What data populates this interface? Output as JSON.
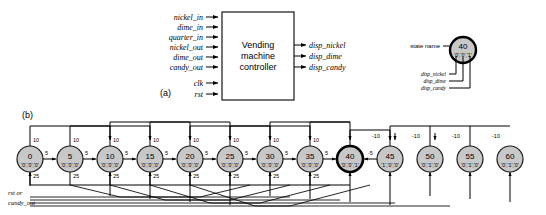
{
  "figure": {
    "part_a_label": "(a)",
    "part_b_label": "(b)"
  },
  "block_diagram": {
    "box_title_line1": "Vending",
    "box_title_line2": "machine",
    "box_title_line3": "controller",
    "inputs": [
      "nickel_in",
      "dime_in",
      "quarter_in",
      "nickel_out",
      "dime_out",
      "candy_out"
    ],
    "control_inputs": [
      "clk",
      "rst"
    ],
    "outputs": [
      "disp_nickel",
      "disp_dime",
      "disp_candy"
    ]
  },
  "legend": {
    "state_name_label": "state name",
    "example_state": "40",
    "example_outputs": "'0','0','1'",
    "output_callouts": [
      "disp_nickel",
      "disp_dime",
      "disp_candy"
    ]
  },
  "state_diagram": {
    "reset_label_line1": "rst or",
    "reset_label_line2": "candy_out",
    "states": [
      {
        "name": "0",
        "outputs": "'0','0','0'",
        "accepting": false
      },
      {
        "name": "5",
        "outputs": "'0','0','0'",
        "accepting": false
      },
      {
        "name": "10",
        "outputs": "'0','0','0'",
        "accepting": false
      },
      {
        "name": "15",
        "outputs": "'0','0','0'",
        "accepting": false
      },
      {
        "name": "20",
        "outputs": "'0','0','0'",
        "accepting": false
      },
      {
        "name": "25",
        "outputs": "'0','0','0'",
        "accepting": false
      },
      {
        "name": "30",
        "outputs": "'0','0','0'",
        "accepting": false
      },
      {
        "name": "35",
        "outputs": "'0','0','0'",
        "accepting": false
      },
      {
        "name": "40",
        "outputs": "'0','0','1'",
        "accepting": true
      },
      {
        "name": "45",
        "outputs": "'1','0','0'",
        "accepting": false
      },
      {
        "name": "50",
        "outputs": "'0','1','0'",
        "accepting": false
      },
      {
        "name": "55",
        "outputs": "'0','1','0'",
        "accepting": false
      },
      {
        "name": "60",
        "outputs": "'0','1','0'",
        "accepting": false
      }
    ],
    "transition_labels": {
      "nickel": "5",
      "dime": "10",
      "quarter": "25",
      "dispense_nickel": "-5",
      "dispense_dime": "-10"
    },
    "nickel_edges": [
      "5",
      "5",
      "5",
      "5",
      "5",
      "5",
      "5",
      "5"
    ],
    "dime_edges": [
      "10",
      "10",
      "10",
      "10",
      "10",
      "10",
      "10",
      "10"
    ],
    "quarter_edges": [
      "25",
      "25",
      "25",
      "25",
      "25",
      "25",
      "25",
      "25"
    ],
    "return_dime_edges": [
      "-10",
      "-10",
      "-10",
      "-10"
    ],
    "return_nickel_edge": "-5"
  },
  "colors": {
    "state_fill": "#d0d0d0",
    "stroke": "#1a1a1a",
    "accent": "#000000"
  }
}
